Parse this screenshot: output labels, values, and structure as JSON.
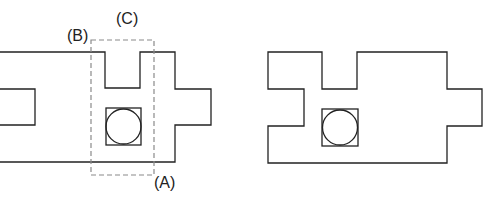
{
  "diagram": {
    "labels": {
      "a": "(A)",
      "b": "(B)",
      "c": "(C)"
    },
    "colors": {
      "stroke": "#222222",
      "dashed": "#8a8a8a",
      "background": "#ffffff"
    },
    "left_figure": {
      "description": "floor plan outline with left notch, top slot, right protrusion, square with inscribed circle, and dashed selection rectangle"
    },
    "right_figure": {
      "description": "modified floor plan outline with square and inscribed circle"
    }
  }
}
